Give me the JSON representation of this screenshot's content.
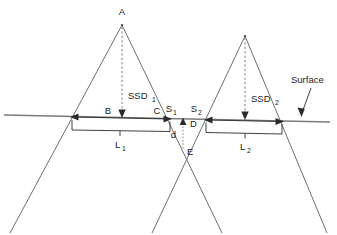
{
  "figure": {
    "type": "diagram",
    "background_color": "#ffffff",
    "line_color": "#6e6e6e",
    "text_color": "#1a1a1a"
  },
  "labels": {
    "apex_left": "A",
    "field_left_inner_edge": "B",
    "field_left_far_edge": "C",
    "match_point_left": "S",
    "match_point_left_sub": "1",
    "match_point_right": "S",
    "match_point_right_sub": "2",
    "junction_surface": "D",
    "junction_depth_point": "E",
    "separation_depth": "d",
    "ssd_left": "SSD",
    "ssd_left_sub": "1",
    "ssd_right": "SSD",
    "ssd_right_sub": "2",
    "field_length_left": "L",
    "field_length_left_sub": "1",
    "field_length_right": "L",
    "field_length_right_sub": "2",
    "surface": "Surface"
  },
  "geometry": {
    "surface_line": {
      "x1": 4,
      "y1": 115,
      "x2": 330,
      "y2": 122
    },
    "apex_left": {
      "x": 122,
      "y": 25
    },
    "apex_right": {
      "x": 245,
      "y": 36
    },
    "beam_left": {
      "left_edge_bottom_x": 10,
      "right_edge_bottom_x": 222,
      "bottom_y": 233
    },
    "beam_right": {
      "left_edge_bottom_x": 152,
      "right_edge_bottom_x": 327,
      "bottom_y": 233
    },
    "bracket_left": {
      "x_start": 72,
      "x_end": 170,
      "y_top": 119,
      "y_bottom": 130
    },
    "bracket_right": {
      "x_start": 206,
      "x_end": 282,
      "y_top": 121,
      "y_bottom": 132
    },
    "crossing_point_E": {
      "x": 182,
      "y": 149
    },
    "junction_point_D": {
      "x": 183,
      "y": 122
    },
    "surface_arrow": {
      "tail_x": 310,
      "tail_y": 88,
      "tip_x": 302,
      "tip_y": 114
    }
  }
}
